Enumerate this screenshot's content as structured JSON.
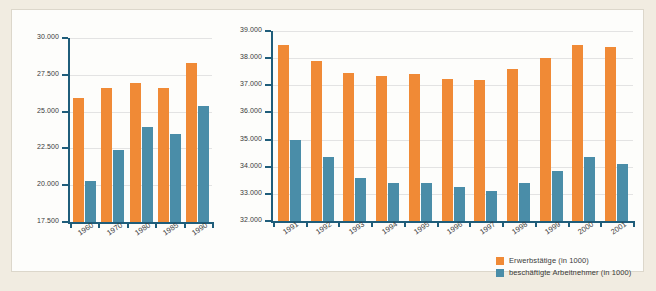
{
  "colors": {
    "series_erwerbstaetige": "#f08a36",
    "series_arbeitnehmer": "#4a8da8",
    "axis": "#1f5d7a",
    "gridline": "#e3e3e3",
    "panel_background": "#fdfdfb",
    "page_background": "#f1ece1",
    "text": "#3a3a3a"
  },
  "legend": {
    "position": "bottom-right",
    "items": [
      {
        "key": "erwerbstaetige",
        "label": "Erwerbstätige (in 1000)",
        "color": "#f08a36"
      },
      {
        "key": "arbeitnehmer",
        "label": "beschäftigte Arbeitnehmer (in 1000)",
        "color": "#4a8da8"
      }
    ]
  },
  "chart_data": [
    {
      "id": "chart-left",
      "type": "bar",
      "title": "",
      "xlabel": "",
      "ylabel": "",
      "categories": [
        "1960",
        "1970",
        "1980",
        "1985",
        "1990"
      ],
      "ylim": [
        17500,
        30000
      ],
      "yticks": [
        17500,
        20000,
        22500,
        25000,
        27500,
        30000
      ],
      "ytick_labels": [
        "17.500",
        "20.000",
        "22.500",
        "25.000",
        "27.500",
        "30.000"
      ],
      "grid": true,
      "series": [
        {
          "name": "Erwerbstätige (in 1000)",
          "color": "#f08a36",
          "values": [
            25900,
            26600,
            26950,
            26600,
            28300
          ]
        },
        {
          "name": "beschäftigte Arbeitnehmer (in 1000)",
          "color": "#4a8da8",
          "values": [
            20300,
            22400,
            23950,
            23500,
            25400
          ]
        }
      ]
    },
    {
      "id": "chart-right",
      "type": "bar",
      "title": "",
      "xlabel": "",
      "ylabel": "",
      "categories": [
        "1991",
        "1992",
        "1993",
        "1994",
        "1995",
        "1996",
        "1997",
        "1998",
        "1999",
        "2000",
        "2001"
      ],
      "ylim": [
        32000,
        39000
      ],
      "yticks": [
        32000,
        33000,
        34000,
        35000,
        36000,
        37000,
        38000,
        39000
      ],
      "ytick_labels": [
        "32.000",
        "33.000",
        "34.000",
        "35.000",
        "36.000",
        "37.000",
        "38.000",
        "39.000"
      ],
      "grid": true,
      "series": [
        {
          "name": "Erwerbstätige (in 1000)",
          "color": "#f08a36",
          "values": [
            38500,
            37900,
            37450,
            37350,
            37400,
            37250,
            37200,
            37600,
            38000,
            38500,
            38400
          ]
        },
        {
          "name": "beschäftigte Arbeitnehmer (in 1000)",
          "color": "#4a8da8",
          "values": [
            35000,
            34350,
            33600,
            33400,
            33400,
            33250,
            33100,
            33400,
            33850,
            34350,
            34100
          ]
        }
      ]
    }
  ]
}
